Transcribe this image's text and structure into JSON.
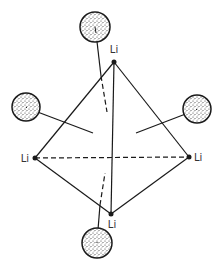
{
  "diagram": {
    "colors": {
      "line": "#1a1a1a",
      "sphere_fill": "#ffffff",
      "stipple": "#333333",
      "text": "#333333"
    },
    "vertices": [
      {
        "id": "top",
        "label": "Li",
        "x": 114,
        "y": 62,
        "label_x": 114,
        "label_y": 53,
        "anchor": "middle"
      },
      {
        "id": "left",
        "label": "Li",
        "x": 35,
        "y": 158,
        "label_x": 29,
        "label_y": 162,
        "anchor": "end"
      },
      {
        "id": "right",
        "label": "Li",
        "x": 189,
        "y": 157,
        "label_x": 194,
        "label_y": 161,
        "anchor": "start"
      },
      {
        "id": "bottom",
        "label": "Li",
        "x": 111,
        "y": 214,
        "label_x": 112,
        "label_y": 228,
        "anchor": "middle"
      }
    ],
    "spheres": [
      {
        "id": "top-sphere",
        "cx": 95,
        "cy": 27,
        "r": 15
      },
      {
        "id": "left-sphere",
        "cx": 26,
        "cy": 107,
        "r": 14
      },
      {
        "id": "right-sphere",
        "cx": 197,
        "cy": 109,
        "r": 14
      },
      {
        "id": "bottom-sphere",
        "cx": 97,
        "cy": 243,
        "r": 15
      }
    ]
  }
}
